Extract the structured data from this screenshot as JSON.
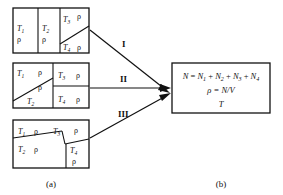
{
  "figure": {
    "panel_a_label": "(a)",
    "panel_b_label": "(b)",
    "symbols": {
      "rho": "ρ",
      "T": "T",
      "N": "N",
      "V": "V"
    },
    "configurations": [
      {
        "id": "config-I",
        "arrow_label": "I",
        "description": "two vertical strips plus a diagonally split third strip",
        "cells": [
          {
            "temperature": "T",
            "index": "1",
            "density": "ρ"
          },
          {
            "temperature": "T",
            "index": "2",
            "density": "ρ"
          },
          {
            "temperature": "T",
            "index": "3",
            "density": "ρ"
          },
          {
            "temperature": "T",
            "index": "4",
            "density": "ρ"
          }
        ]
      },
      {
        "id": "config-II",
        "arrow_label": "II",
        "description": "left half diagonally split, right half horizontally split",
        "cells": [
          {
            "temperature": "T",
            "index": "1",
            "density": "ρ"
          },
          {
            "temperature": "T",
            "index": "2",
            "density": "ρ"
          },
          {
            "temperature": "T",
            "index": "3",
            "density": "ρ"
          },
          {
            "temperature": "T",
            "index": "4",
            "density": "ρ"
          }
        ]
      },
      {
        "id": "config-III",
        "arrow_label": "III",
        "description": "irregular four-region partition with slanted boundaries",
        "cells": [
          {
            "temperature": "T",
            "index": "1",
            "density": "ρ"
          },
          {
            "temperature": "T",
            "index": "2",
            "density": "ρ"
          },
          {
            "temperature": "T",
            "index": "3",
            "density": "ρ"
          },
          {
            "temperature": "T",
            "index": "4",
            "density": "ρ"
          }
        ]
      }
    ],
    "result_box": {
      "line1": {
        "lhs": "N",
        "equals": "=",
        "terms": [
          {
            "base": "N",
            "sub": "1"
          },
          {
            "base": "N",
            "sub": "2"
          },
          {
            "base": "N",
            "sub": "3"
          },
          {
            "base": "N",
            "sub": "4"
          }
        ],
        "plus": "+",
        "plain": "N = N1 + N2 + N3 + N4"
      },
      "line2": "ρ = N/V",
      "line3": "T"
    },
    "arrows": [
      {
        "label": "I"
      },
      {
        "label": "II"
      },
      {
        "label": "III"
      }
    ],
    "colors": {
      "stroke": "#111111",
      "background": "#ffffff",
      "text": "#111111"
    }
  }
}
